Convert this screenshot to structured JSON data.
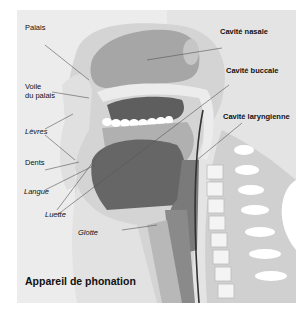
{
  "figure": {
    "caption": "Appareil de phonation",
    "colors": {
      "background": "#ececec",
      "tissue_light": "#d2d2d2",
      "tissue_mid": "#b4b4b4",
      "nasal_cavity": "#a6a6a6",
      "tongue": "#666666",
      "throat_dark": "#7a7a7a",
      "teeth": "#ffffff",
      "leader_line": "#555555"
    },
    "labels_left": [
      {
        "text": "Palais",
        "italic": false
      },
      {
        "text": "Voile",
        "italic": false
      },
      {
        "text": "du palais",
        "italic": false
      },
      {
        "text": "Lèvres",
        "italic": true
      },
      {
        "text": "Dents",
        "italic": false
      },
      {
        "text": "Langue",
        "italic": true
      },
      {
        "text": "Luette",
        "italic": true
      },
      {
        "text": "Glotte",
        "italic": true
      }
    ],
    "labels_right": [
      {
        "text": "Cavité nasale"
      },
      {
        "text": "Cavité buccale"
      },
      {
        "text": "Cavité laryngienne"
      }
    ]
  }
}
